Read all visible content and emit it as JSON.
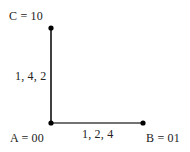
{
  "diagram": {
    "type": "graph",
    "nodes": [
      {
        "id": "C",
        "label": "C = 10",
        "x": 51,
        "y": 28
      },
      {
        "id": "A",
        "label": "A = 00",
        "x": 51,
        "y": 123
      },
      {
        "id": "B",
        "label": "B = 01",
        "x": 143,
        "y": 123
      }
    ],
    "edges": [
      {
        "from": "A",
        "to": "C",
        "label": "1, 4, 2"
      },
      {
        "from": "A",
        "to": "B",
        "label": "1, 2, 4"
      }
    ],
    "colors": {
      "edge_vertical": "#111111",
      "edge_horizontal": "#444444",
      "node": "#000000",
      "text": "#222222"
    }
  }
}
